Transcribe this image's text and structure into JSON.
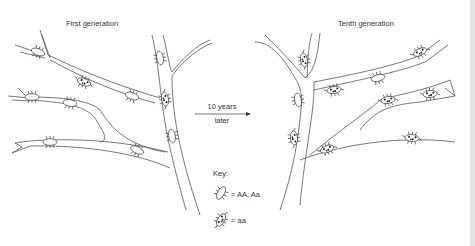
{
  "diagram": {
    "panels": [
      {
        "id": "left",
        "title": "First generation"
      },
      {
        "id": "right",
        "title": "Tenth generation"
      }
    ],
    "transition": {
      "line1": "10 years",
      "line2": "later"
    },
    "key": {
      "title": "Key:",
      "items": [
        {
          "icon": "plain-beetle-icon",
          "label": "= AA, Aa"
        },
        {
          "icon": "spotted-beetle-icon",
          "label": "= aa"
        }
      ]
    }
  }
}
